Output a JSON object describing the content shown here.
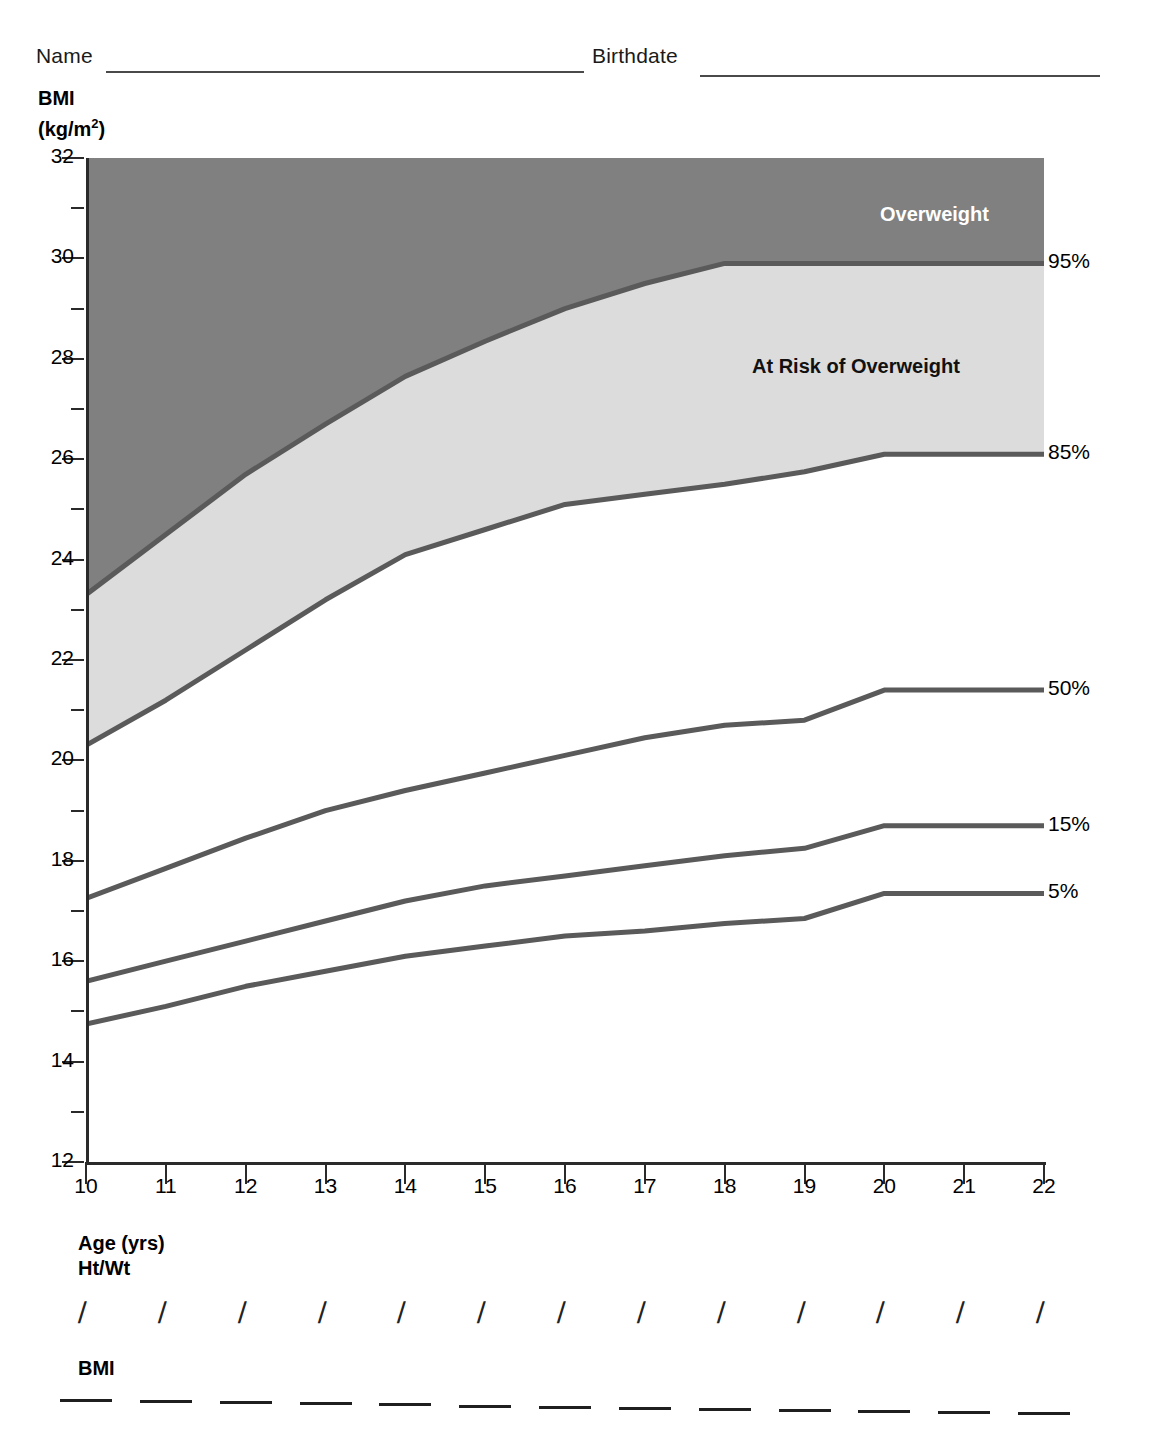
{
  "form": {
    "name_label": "Name",
    "birthdate_label": "Birthdate"
  },
  "axes": {
    "y_title_line1": "BMI",
    "y_title_line2_pre": "(kg/m",
    "y_title_sup": "2",
    "y_title_post": ")",
    "x_title": "Age (yrs)"
  },
  "rows": {
    "htwt_label": "Ht/Wt",
    "bmi_label": "BMI",
    "htwt_marks": [
      "/",
      "/",
      "/",
      "/",
      "/",
      "/",
      "/",
      "/",
      "/",
      "/",
      "/",
      "/",
      "/"
    ],
    "bmi_marks": [
      "",
      "",
      "",
      "",
      "",
      "",
      "",
      "",
      "",
      "",
      "",
      "",
      ""
    ]
  },
  "zones": [
    {
      "name": "overweight",
      "label": "Overweight",
      "color": "#808080",
      "text_color": "#ffffff"
    },
    {
      "name": "at-risk",
      "label": "At Risk of Overweight",
      "color": "#dcdcdc",
      "text_color": "#111111"
    },
    {
      "name": "normal",
      "label": "",
      "color": "#ffffff",
      "text_color": "#000000"
    }
  ],
  "chart_data": {
    "type": "line",
    "xlabel": "Age (yrs)",
    "ylabel": "BMI (kg/m2)",
    "xlim": [
      10,
      22
    ],
    "ylim": [
      12,
      32
    ],
    "xticks": [
      10,
      11,
      12,
      13,
      14,
      15,
      16,
      17,
      18,
      19,
      20,
      21,
      22
    ],
    "yticks": [
      12,
      14,
      16,
      18,
      20,
      22,
      24,
      26,
      28,
      30,
      32
    ],
    "yminorticks": [
      13,
      15,
      17,
      19,
      21,
      23,
      25,
      27,
      29,
      31
    ],
    "grid": false,
    "legend_position": "right-inline",
    "line_color": "#5a5a5a",
    "axis_color": "#2a2a2a",
    "x": [
      10,
      11,
      12,
      13,
      14,
      15,
      16,
      17,
      18,
      19,
      20,
      21
    ],
    "series": [
      {
        "name": "95%",
        "label": "95%",
        "values": [
          23.3,
          24.5,
          25.7,
          26.7,
          27.65,
          28.35,
          29.0,
          29.5,
          29.9,
          29.9,
          29.9,
          29.9
        ]
      },
      {
        "name": "85%",
        "label": "85%",
        "values": [
          20.3,
          21.2,
          22.2,
          23.2,
          24.1,
          24.6,
          25.1,
          25.3,
          25.5,
          25.75,
          26.1,
          26.1
        ]
      },
      {
        "name": "50%",
        "label": "50%",
        "values": [
          17.25,
          17.85,
          18.45,
          19.0,
          19.4,
          19.75,
          20.1,
          20.45,
          20.7,
          20.8,
          21.4,
          21.4
        ]
      },
      {
        "name": "15%",
        "label": "15%",
        "values": [
          15.6,
          16.0,
          16.4,
          16.8,
          17.2,
          17.5,
          17.7,
          17.9,
          18.1,
          18.25,
          18.7,
          18.7
        ]
      },
      {
        "name": "5%",
        "label": "5%",
        "values": [
          14.75,
          15.1,
          15.5,
          15.8,
          16.1,
          16.3,
          16.5,
          16.6,
          16.75,
          16.85,
          17.35,
          17.35
        ]
      }
    ],
    "annotations": [
      {
        "text": "Overweight",
        "x": 19.4,
        "y": 31.0
      },
      {
        "text": "At Risk of Overweight",
        "x": 17.8,
        "y": 28.2
      }
    ]
  }
}
